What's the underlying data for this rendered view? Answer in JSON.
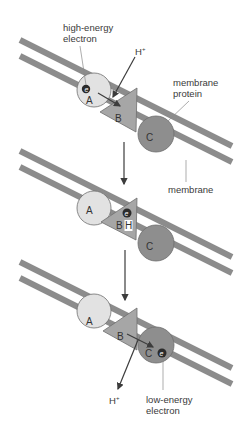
{
  "colors": {
    "background": "#ffffff",
    "membrane": "#8c8c8c",
    "protein_a": "#e2e2e2",
    "protein_b": "#a6a6a6",
    "protein_c": "#8e8e8e",
    "outline": "#6e6e6e",
    "electron": "#2b2b2b",
    "arrow": "#3c3c3c",
    "leader_line": "#8a8a8a",
    "text": "#3a3a3a"
  },
  "panels": [
    {
      "id": "step-1",
      "proteins": {
        "a": "A",
        "b": "B",
        "c": "C"
      },
      "electron_symbol": "e",
      "electron_location": "A",
      "labels": {
        "high_energy_electron_1": "high-energy",
        "high_energy_electron_2": "electron",
        "proton_in": "H",
        "proton_superscript": "+",
        "membrane_protein_1": "membrane",
        "membrane_protein_2": "protein"
      }
    },
    {
      "id": "step-2",
      "proteins": {
        "a": "A",
        "b": "B",
        "c": "C"
      },
      "electron_symbol": "e",
      "electron_location": "B",
      "bound_proton": "H",
      "labels": {
        "membrane": "membrane"
      }
    },
    {
      "id": "step-3",
      "proteins": {
        "a": "A",
        "b": "B",
        "c": "C"
      },
      "electron_symbol": "e",
      "electron_location": "C",
      "labels": {
        "proton_out": "H",
        "proton_superscript": "+",
        "low_energy_electron_1": "low-energy",
        "low_energy_electron_2": "electron"
      }
    }
  ],
  "transitions": [
    {
      "from": "step-1",
      "to": "step-2"
    },
    {
      "from": "step-2",
      "to": "step-3"
    }
  ]
}
